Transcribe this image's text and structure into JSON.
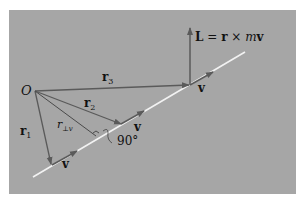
{
  "figure": {
    "type": "physics-vector-diagram",
    "colors": {
      "background": "#a6a6a6",
      "page": "#ffffff",
      "path_line": "#f2f2f2",
      "vectors": "#5a5a5a",
      "text": "#111111"
    }
  },
  "labels": {
    "origin": "O",
    "angular_momentum": {
      "lhs": "L",
      "eq": " = ",
      "r": "r",
      "cross": " × ",
      "m": "m",
      "v": "v"
    },
    "r1": {
      "base": "r",
      "sub": "1"
    },
    "r2": {
      "base": "r",
      "sub": "2"
    },
    "r3": {
      "base": "r",
      "sub": "3"
    },
    "r_perp": {
      "base": "r",
      "sub": "⊥v"
    },
    "v1": "v",
    "v2": "v",
    "v3": "v",
    "right_angle": "90°"
  }
}
